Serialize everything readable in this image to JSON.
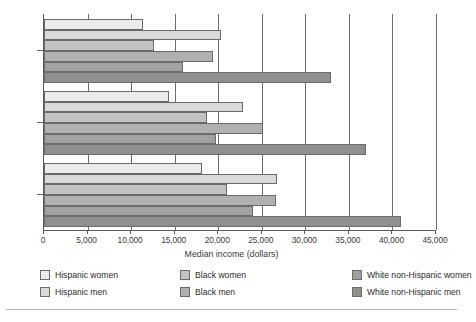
{
  "chart_data": {
    "type": "bar",
    "orientation": "horizontal",
    "title": "",
    "xlabel": "Median income (dollars)",
    "ylabel": "",
    "xlim": [
      0,
      45000
    ],
    "xticks": [
      0,
      5000,
      10000,
      15000,
      20000,
      25000,
      30000,
      35000,
      40000,
      45000
    ],
    "xticklabels": [
      "0",
      "5,000",
      "10,000",
      "15,000",
      "20,000",
      "25,000",
      "30,000",
      "35,000",
      "40,000",
      "45,000"
    ],
    "categories": [
      "1990",
      "2000",
      "2014"
    ],
    "grid": "vertical",
    "legend_position": "bottom",
    "series": [
      {
        "name": "Hispanic women",
        "color": "#ececeb",
        "values": [
          11400,
          14300,
          18100
        ]
      },
      {
        "name": "Hispanic men",
        "color": "#d9d9d7",
        "values": [
          20300,
          22800,
          26700
        ]
      },
      {
        "name": "Black women",
        "color": "#c2c2c0",
        "values": [
          12600,
          18700,
          21000
        ]
      },
      {
        "name": "Black men",
        "color": "#b0b0ae",
        "values": [
          19400,
          25100,
          26600
        ]
      },
      {
        "name": "White non-Hispanic women",
        "color": "#a2a2a0",
        "values": [
          16000,
          19700,
          24000
        ]
      },
      {
        "name": "White non-Hispanic men",
        "color": "#8f8f8d",
        "values": [
          33000,
          37000,
          41000
        ]
      }
    ]
  },
  "legend": {
    "items": [
      {
        "label": "Hispanic women",
        "swatch": "#ececeb"
      },
      {
        "label": "Hispanic men",
        "swatch": "#d9d9d7"
      },
      {
        "label": "Black women",
        "swatch": "#c2c2c0"
      },
      {
        "label": "Black men",
        "swatch": "#b0b0ae"
      },
      {
        "label": "White non-Hispanic women",
        "swatch": "#a2a2a0"
      },
      {
        "label": "White non-Hispanic men",
        "swatch": "#8f8f8d"
      }
    ]
  }
}
